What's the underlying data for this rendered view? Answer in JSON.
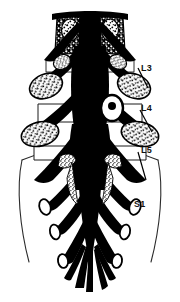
{
  "figure": {
    "colors": {
      "background": "#ffffff",
      "ink": "#000000",
      "outline": "#2b2b2b",
      "rule": "#b4b4b4",
      "label": "#111111"
    },
    "border_rule": {
      "name": "left-vertical-rule",
      "orientation": "vertical",
      "x": 7,
      "color": "#b4b4b4"
    }
  },
  "labels": [
    {
      "id": "l3",
      "text": "L3",
      "x": 141,
      "y": 64,
      "level": "Lumbar 3"
    },
    {
      "id": "l4",
      "text": "L4",
      "x": 141,
      "y": 104,
      "level": "Lumbar 4"
    },
    {
      "id": "l5",
      "text": "L5",
      "x": 141,
      "y": 146,
      "level": "Lumbar 5"
    },
    {
      "id": "s1",
      "text": "S1",
      "x": 134,
      "y": 200,
      "level": "Sacral 1"
    }
  ],
  "structures": {
    "thecal_sac": "central vertical black column",
    "nerve_roots": "paired oblique black branches",
    "ganglia": "stippled oval dorsal root ganglia",
    "cauda_equina": "fanned inferior rootlets",
    "sacral_outline": "thin curved outline of sacral canal"
  }
}
